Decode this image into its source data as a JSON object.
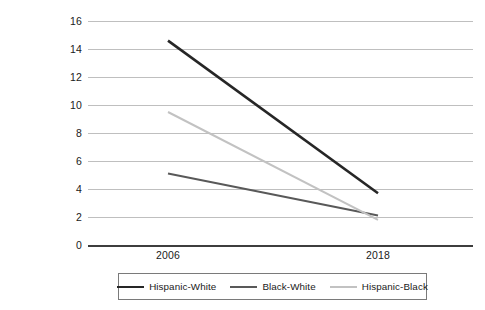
{
  "chart_data": {
    "type": "line",
    "title": "",
    "xlabel": "",
    "ylabel": "Percent not currently in school and have not earned a high school diploma or an equivalency certificate",
    "categories": [
      "2006",
      "2018"
    ],
    "x": [
      2006,
      2018
    ],
    "xtick_labels": [
      "2006",
      "2018"
    ],
    "ytick_labels": [
      "0",
      "2",
      "4",
      "6",
      "8",
      "10",
      "12",
      "14",
      "16"
    ],
    "yticks": [
      0,
      2,
      4,
      6,
      8,
      10,
      12,
      14,
      16
    ],
    "ylim": [
      0,
      16
    ],
    "grid": true,
    "legend_position": "bottom",
    "series": [
      {
        "name": "Hispanic-White",
        "values": [
          14.6,
          3.7
        ],
        "color": "#262626",
        "width": 2.6
      },
      {
        "name": "Black-White",
        "values": [
          5.1,
          2.1
        ],
        "color": "#595959",
        "width": 2.0
      },
      {
        "name": "Hispanic-Black",
        "values": [
          9.5,
          1.8
        ],
        "color": "#c2c2c2",
        "width": 2.0
      }
    ]
  },
  "legend": {
    "entries": [
      {
        "label": "Hispanic-White",
        "color": "#262626",
        "width": 2.6
      },
      {
        "label": "Black-White",
        "color": "#595959",
        "width": 2.2
      },
      {
        "label": "Hispanic-Black",
        "color": "#c2c2c2",
        "width": 2.0
      }
    ]
  },
  "colors": {
    "gridline": "#bfbfbf",
    "axis": "#3d3d3d",
    "text": "#1a1a1a",
    "legend_border": "#7a7a7a",
    "background": "#ffffff"
  }
}
